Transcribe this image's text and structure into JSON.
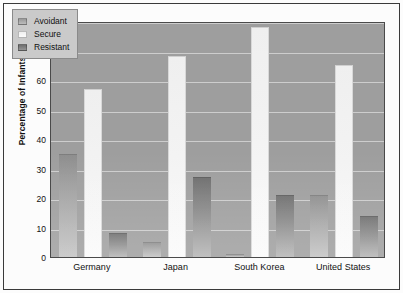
{
  "chart_data": {
    "type": "bar",
    "title": "",
    "subtitle": "",
    "xlabel": "",
    "ylabel": "Percentage of Infants",
    "ylim": [
      0,
      80
    ],
    "ytick_step": 10,
    "yticks": [
      "80",
      "70",
      "60",
      "50",
      "40",
      "30",
      "20",
      "10",
      "0"
    ],
    "grid": true,
    "grid_axis": "y",
    "legend_position": "top-left-inside",
    "categories": [
      "Germany",
      "Japan",
      "South Korea",
      "United States"
    ],
    "series": [
      {
        "name": "Avoidant",
        "values": [
          35,
          5,
          1,
          21
        ]
      },
      {
        "name": "Secure",
        "values": [
          57,
          68,
          78,
          65
        ]
      },
      {
        "name": "Resistant",
        "values": [
          8,
          27,
          21,
          14
        ]
      }
    ]
  },
  "legend": {
    "items": [
      {
        "label": "Avoidant",
        "swatch": "avoidant-swatch"
      },
      {
        "label": "Secure",
        "swatch": "secure-swatch"
      },
      {
        "label": "Resistant",
        "swatch": "resistant-swatch"
      }
    ]
  },
  "colors": {
    "plot_background": "#9e9e9e",
    "page_background": "#fcfcfc",
    "gridline": "#d5d5d5",
    "frame": "#4a4a4a",
    "avoidant": "#a6a6a6",
    "secure": "#f3f3f3",
    "resistant": "#8a8a8a",
    "text": "#111111",
    "legend_background": "#cacaca"
  }
}
